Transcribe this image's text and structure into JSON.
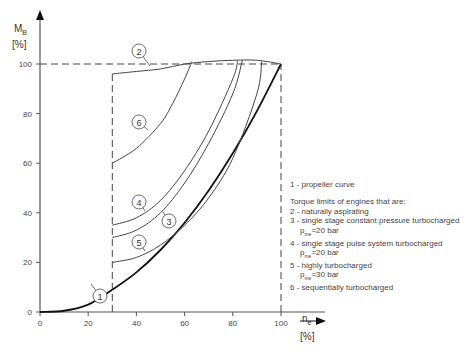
{
  "chart_data": {
    "type": "line",
    "title": "",
    "xlabel": "n_e [%]",
    "ylabel": "M_B [%]",
    "xlim": [
      0,
      100
    ],
    "ylim": [
      0,
      100
    ],
    "x_ticks": [
      "0",
      "20",
      "40",
      "60",
      "80",
      "100"
    ],
    "y_ticks": [
      "0",
      "20",
      "40",
      "60",
      "80",
      "100"
    ],
    "grid": false,
    "reference_lines": [
      {
        "type": "horizontal-dashed",
        "y": 100,
        "x_range": [
          0,
          100
        ]
      },
      {
        "type": "vertical-dashed",
        "x": 30,
        "y_range": [
          0,
          97
        ]
      },
      {
        "type": "vertical-dashed",
        "x": 100,
        "y_range": [
          0,
          100
        ]
      }
    ],
    "series": [
      {
        "name": "1",
        "label": "propeller curve",
        "x": [
          0,
          10,
          20,
          30,
          40,
          50,
          60,
          70,
          80,
          90,
          100
        ],
        "y": [
          0,
          0.5,
          3,
          9,
          16,
          25,
          36,
          49,
          64,
          81,
          100
        ]
      },
      {
        "name": "2",
        "label": "naturally aspirating",
        "x": [
          30,
          40,
          50,
          60,
          70,
          80,
          90,
          100
        ],
        "y": [
          96,
          97,
          98,
          100,
          101,
          101.5,
          101.5,
          100
        ]
      },
      {
        "name": "3",
        "label": "single stage constant pressure turbocharged p_me=20 bar",
        "x": [
          30,
          40,
          50,
          60,
          70,
          80,
          84
        ],
        "y": [
          30,
          33,
          40,
          52,
          68,
          88,
          101.5
        ]
      },
      {
        "name": "4",
        "label": "single stage pulse system turbocharged p_me=20 bar",
        "x": [
          30,
          40,
          50,
          60,
          70,
          80,
          82
        ],
        "y": [
          35,
          38,
          45,
          57,
          73,
          94,
          101.5
        ]
      },
      {
        "name": "5",
        "label": "highly turbocharged p_me=30 bar",
        "x": [
          30,
          40,
          50,
          60,
          70,
          80,
          90,
          92
        ],
        "y": [
          20,
          22,
          27,
          35,
          46,
          62,
          88,
          101
        ]
      },
      {
        "name": "6",
        "label": "sequentially turbocharged",
        "x": [
          30,
          40,
          50,
          55,
          60,
          63
        ],
        "y": [
          60,
          66,
          76,
          84,
          94,
          101
        ]
      }
    ],
    "legend": {
      "position": "right",
      "items": [
        "1 - propeller curve",
        "Torque limits of engines that are:",
        "2 - naturally aspirating",
        "3 - single stage constant pressure turbocharged",
        "p_me=20 bar",
        "4 - single stage pulse system turbocharged",
        "p_me=20 bar",
        "5 - highly turbocharged",
        "p_me=30 bar",
        "6 - sequentially turbocharged"
      ]
    }
  },
  "axes": {
    "y_label_main": "M",
    "y_label_sub": "B",
    "y_unit": "[%]",
    "x_label_main": "n",
    "x_label_sub": "e",
    "x_unit": "[%]"
  },
  "curve_labels": [
    "1",
    "2",
    "3",
    "4",
    "5",
    "6"
  ],
  "legend": {
    "l1": "1 - propeller curve",
    "heading": "Torque limits of engines that are:",
    "l2": "2 - naturally aspirating",
    "l3": "3 - single stage constant pressure turbocharged",
    "l3b_pre": "p",
    "l3b_sub": "me",
    "l3b_post": "=20 bar",
    "l4": "4 - single stage pulse system turbocharged",
    "l4b_pre": "p",
    "l4b_sub": "me",
    "l4b_post": "=20 bar",
    "l5": "5 - highly turbocharged",
    "l5b_pre": "p",
    "l5b_sub": "me",
    "l5b_post": "=30 bar",
    "l6": "6 - sequentially turbocharged"
  }
}
